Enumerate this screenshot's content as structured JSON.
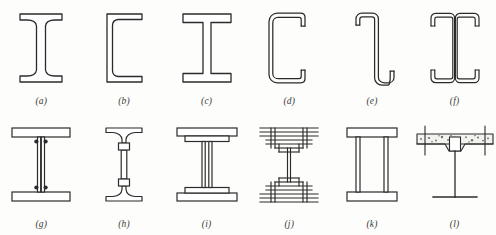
{
  "figure": {
    "background_color": "#fdfdfb",
    "ink_color": "#2b2b2b",
    "rows": 2,
    "columns": 6,
    "total_items": 12
  },
  "items": [
    {
      "key": "a",
      "label": "(a)",
      "name": "rolled-i-beam-tapered-flange",
      "description": "Rolled I-beam (S-shape) with tapered flanges and filleted web-flange junctions",
      "row": "top",
      "column": 1
    },
    {
      "key": "b",
      "label": "(b)",
      "name": "rolled-channel-section",
      "description": "Rolled channel (C-shape) with tapered flanges",
      "row": "top",
      "column": 2
    },
    {
      "key": "c",
      "label": "(c)",
      "name": "wide-flange-h-beam",
      "description": "Wide-flange (W / H) beam with parallel flanges",
      "row": "top",
      "column": 3
    },
    {
      "key": "d",
      "label": "(d)",
      "name": "cold-formed-lipped-channel",
      "description": "Cold-formed lipped channel (C-section) with rounded corners",
      "row": "top",
      "column": 4
    },
    {
      "key": "e",
      "label": "(e)",
      "name": "cold-formed-lipped-zed",
      "description": "Cold-formed lipped Z-section (zed purlin) with rounded corners",
      "row": "top",
      "column": 5
    },
    {
      "key": "f",
      "label": "(f)",
      "name": "back-to-back-double-channel",
      "description": "Two cold-formed lipped channels placed back to back",
      "row": "top",
      "column": 6
    },
    {
      "key": "g",
      "label": "(g)",
      "name": "riveted-plate-girder-with-angles",
      "description": "Built-up riveted plate girder: web plate, four flange angles and rivet heads",
      "row": "bottom",
      "column": 1
    },
    {
      "key": "h",
      "label": "(h)",
      "name": "castellated-tee-and-web-beam",
      "description": "Beam built from two tee sections connected by a slender web with splice plates",
      "row": "bottom",
      "column": 2
    },
    {
      "key": "i",
      "label": "(i)",
      "name": "welded-plate-girder-with-cover-plates",
      "description": "Welded plate girder with additional flange cover plates",
      "row": "bottom",
      "column": 3
    },
    {
      "key": "j",
      "label": "(j)",
      "name": "built-up-riveted-girder-cover-plates",
      "description": "Heavily built-up riveted girder with flange angles and multiple cover plates",
      "row": "bottom",
      "column": 4
    },
    {
      "key": "k",
      "label": "(k)",
      "name": "welded-box-girder",
      "description": "Welded box girder with two vertical web plates and top and bottom flange plates",
      "row": "bottom",
      "column": 5
    },
    {
      "key": "l",
      "label": "(l)",
      "name": "composite-beam-with-concrete-slab",
      "description": "Steel tee beam acting compositely with a concrete slab over the top flange",
      "row": "bottom",
      "column": 6
    }
  ]
}
